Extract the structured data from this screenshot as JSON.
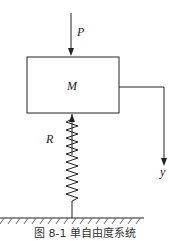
{
  "diagram": {
    "type": "single-degree-of-freedom spring-mass system",
    "labels": {
      "force": "P",
      "mass": "M",
      "reaction": "R",
      "displacement_axis": "y"
    },
    "caption": "图 8-1  单自由度系统",
    "colors": {
      "line": "#222222",
      "background": "#ffffff"
    }
  }
}
